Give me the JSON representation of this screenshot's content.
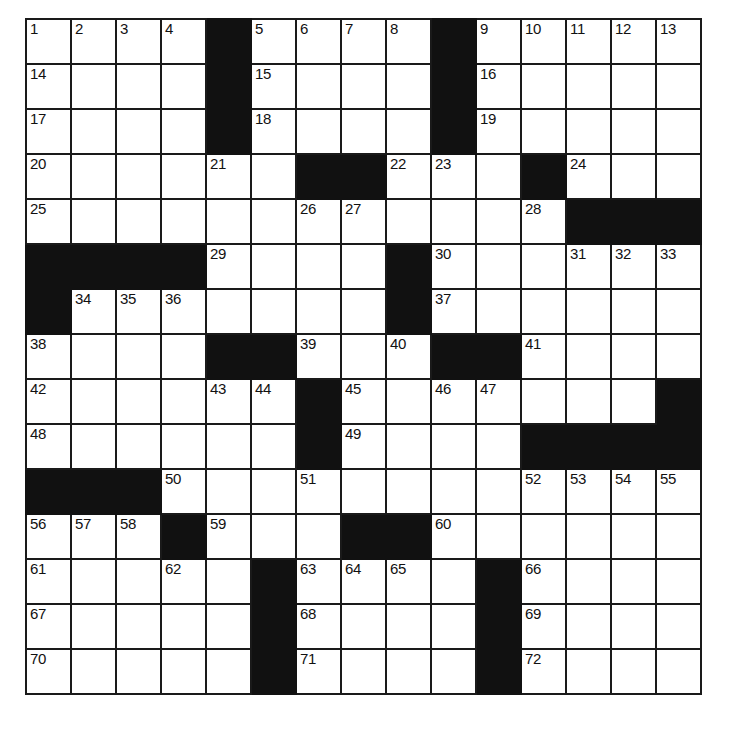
{
  "puzzle": {
    "type": "crossword-grid",
    "rows": 15,
    "columns": 15,
    "cell_size_px": 45,
    "colors": {
      "block": "#111111",
      "cell": "#ffffff",
      "grid_line": "#1a1a1a",
      "number_text": "#111111"
    },
    "grid": [
      [
        {
          "block": false,
          "number": "1"
        },
        {
          "block": false,
          "number": "2"
        },
        {
          "block": false,
          "number": "3"
        },
        {
          "block": false,
          "number": "4"
        },
        {
          "block": true,
          "number": ""
        },
        {
          "block": false,
          "number": "5"
        },
        {
          "block": false,
          "number": "6"
        },
        {
          "block": false,
          "number": "7"
        },
        {
          "block": false,
          "number": "8"
        },
        {
          "block": true,
          "number": ""
        },
        {
          "block": false,
          "number": "9"
        },
        {
          "block": false,
          "number": "10"
        },
        {
          "block": false,
          "number": "11"
        },
        {
          "block": false,
          "number": "12"
        },
        {
          "block": false,
          "number": "13"
        }
      ],
      [
        {
          "block": false,
          "number": "14"
        },
        {
          "block": false,
          "number": ""
        },
        {
          "block": false,
          "number": ""
        },
        {
          "block": false,
          "number": ""
        },
        {
          "block": true,
          "number": ""
        },
        {
          "block": false,
          "number": "15"
        },
        {
          "block": false,
          "number": ""
        },
        {
          "block": false,
          "number": ""
        },
        {
          "block": false,
          "number": ""
        },
        {
          "block": true,
          "number": ""
        },
        {
          "block": false,
          "number": "16"
        },
        {
          "block": false,
          "number": ""
        },
        {
          "block": false,
          "number": ""
        },
        {
          "block": false,
          "number": ""
        },
        {
          "block": false,
          "number": ""
        }
      ],
      [
        {
          "block": false,
          "number": "17"
        },
        {
          "block": false,
          "number": ""
        },
        {
          "block": false,
          "number": ""
        },
        {
          "block": false,
          "number": ""
        },
        {
          "block": true,
          "number": ""
        },
        {
          "block": false,
          "number": "18"
        },
        {
          "block": false,
          "number": ""
        },
        {
          "block": false,
          "number": ""
        },
        {
          "block": false,
          "number": ""
        },
        {
          "block": true,
          "number": ""
        },
        {
          "block": false,
          "number": "19"
        },
        {
          "block": false,
          "number": ""
        },
        {
          "block": false,
          "number": ""
        },
        {
          "block": false,
          "number": ""
        },
        {
          "block": false,
          "number": ""
        }
      ],
      [
        {
          "block": false,
          "number": "20"
        },
        {
          "block": false,
          "number": ""
        },
        {
          "block": false,
          "number": ""
        },
        {
          "block": false,
          "number": ""
        },
        {
          "block": false,
          "number": "21"
        },
        {
          "block": false,
          "number": ""
        },
        {
          "block": true,
          "number": ""
        },
        {
          "block": true,
          "number": ""
        },
        {
          "block": false,
          "number": "22"
        },
        {
          "block": false,
          "number": "23"
        },
        {
          "block": false,
          "number": ""
        },
        {
          "block": true,
          "number": ""
        },
        {
          "block": false,
          "number": "24"
        },
        {
          "block": false,
          "number": ""
        },
        {
          "block": false,
          "number": ""
        }
      ],
      [
        {
          "block": false,
          "number": "25"
        },
        {
          "block": false,
          "number": ""
        },
        {
          "block": false,
          "number": ""
        },
        {
          "block": false,
          "number": ""
        },
        {
          "block": false,
          "number": ""
        },
        {
          "block": false,
          "number": ""
        },
        {
          "block": false,
          "number": "26"
        },
        {
          "block": false,
          "number": "27"
        },
        {
          "block": false,
          "number": ""
        },
        {
          "block": false,
          "number": ""
        },
        {
          "block": false,
          "number": ""
        },
        {
          "block": false,
          "number": "28"
        },
        {
          "block": true,
          "number": ""
        },
        {
          "block": true,
          "number": ""
        },
        {
          "block": true,
          "number": ""
        }
      ],
      [
        {
          "block": true,
          "number": ""
        },
        {
          "block": true,
          "number": ""
        },
        {
          "block": true,
          "number": ""
        },
        {
          "block": true,
          "number": ""
        },
        {
          "block": false,
          "number": "29"
        },
        {
          "block": false,
          "number": ""
        },
        {
          "block": false,
          "number": ""
        },
        {
          "block": false,
          "number": ""
        },
        {
          "block": true,
          "number": ""
        },
        {
          "block": false,
          "number": "30"
        },
        {
          "block": false,
          "number": ""
        },
        {
          "block": false,
          "number": ""
        },
        {
          "block": false,
          "number": "31"
        },
        {
          "block": false,
          "number": "32"
        },
        {
          "block": false,
          "number": "33"
        }
      ],
      [
        {
          "block": true,
          "number": ""
        },
        {
          "block": false,
          "number": "34"
        },
        {
          "block": false,
          "number": "35"
        },
        {
          "block": false,
          "number": "36"
        },
        {
          "block": false,
          "number": ""
        },
        {
          "block": false,
          "number": ""
        },
        {
          "block": false,
          "number": ""
        },
        {
          "block": false,
          "number": ""
        },
        {
          "block": true,
          "number": ""
        },
        {
          "block": false,
          "number": "37"
        },
        {
          "block": false,
          "number": ""
        },
        {
          "block": false,
          "number": ""
        },
        {
          "block": false,
          "number": ""
        },
        {
          "block": false,
          "number": ""
        },
        {
          "block": false,
          "number": ""
        }
      ],
      [
        {
          "block": false,
          "number": "38"
        },
        {
          "block": false,
          "number": ""
        },
        {
          "block": false,
          "number": ""
        },
        {
          "block": false,
          "number": ""
        },
        {
          "block": true,
          "number": ""
        },
        {
          "block": true,
          "number": ""
        },
        {
          "block": false,
          "number": "39"
        },
        {
          "block": false,
          "number": ""
        },
        {
          "block": false,
          "number": "40"
        },
        {
          "block": true,
          "number": ""
        },
        {
          "block": true,
          "number": ""
        },
        {
          "block": false,
          "number": "41"
        },
        {
          "block": false,
          "number": ""
        },
        {
          "block": false,
          "number": ""
        },
        {
          "block": false,
          "number": ""
        }
      ],
      [
        {
          "block": false,
          "number": "42"
        },
        {
          "block": false,
          "number": ""
        },
        {
          "block": false,
          "number": ""
        },
        {
          "block": false,
          "number": ""
        },
        {
          "block": false,
          "number": "43"
        },
        {
          "block": false,
          "number": "44"
        },
        {
          "block": true,
          "number": ""
        },
        {
          "block": false,
          "number": "45"
        },
        {
          "block": false,
          "number": ""
        },
        {
          "block": false,
          "number": "46"
        },
        {
          "block": false,
          "number": "47"
        },
        {
          "block": false,
          "number": ""
        },
        {
          "block": false,
          "number": ""
        },
        {
          "block": false,
          "number": ""
        },
        {
          "block": true,
          "number": ""
        }
      ],
      [
        {
          "block": false,
          "number": "48"
        },
        {
          "block": false,
          "number": ""
        },
        {
          "block": false,
          "number": ""
        },
        {
          "block": false,
          "number": ""
        },
        {
          "block": false,
          "number": ""
        },
        {
          "block": false,
          "number": ""
        },
        {
          "block": true,
          "number": ""
        },
        {
          "block": false,
          "number": "49"
        },
        {
          "block": false,
          "number": ""
        },
        {
          "block": false,
          "number": ""
        },
        {
          "block": false,
          "number": ""
        },
        {
          "block": true,
          "number": ""
        },
        {
          "block": true,
          "number": ""
        },
        {
          "block": true,
          "number": ""
        },
        {
          "block": true,
          "number": ""
        }
      ],
      [
        {
          "block": true,
          "number": ""
        },
        {
          "block": true,
          "number": ""
        },
        {
          "block": true,
          "number": ""
        },
        {
          "block": false,
          "number": "50"
        },
        {
          "block": false,
          "number": ""
        },
        {
          "block": false,
          "number": ""
        },
        {
          "block": false,
          "number": "51"
        },
        {
          "block": false,
          "number": ""
        },
        {
          "block": false,
          "number": ""
        },
        {
          "block": false,
          "number": ""
        },
        {
          "block": false,
          "number": ""
        },
        {
          "block": false,
          "number": "52"
        },
        {
          "block": false,
          "number": "53"
        },
        {
          "block": false,
          "number": "54"
        },
        {
          "block": false,
          "number": "55"
        }
      ],
      [
        {
          "block": false,
          "number": "56"
        },
        {
          "block": false,
          "number": "57"
        },
        {
          "block": false,
          "number": "58"
        },
        {
          "block": true,
          "number": ""
        },
        {
          "block": false,
          "number": "59"
        },
        {
          "block": false,
          "number": ""
        },
        {
          "block": false,
          "number": ""
        },
        {
          "block": true,
          "number": ""
        },
        {
          "block": true,
          "number": ""
        },
        {
          "block": false,
          "number": "60"
        },
        {
          "block": false,
          "number": ""
        },
        {
          "block": false,
          "number": ""
        },
        {
          "block": false,
          "number": ""
        },
        {
          "block": false,
          "number": ""
        },
        {
          "block": false,
          "number": ""
        }
      ],
      [
        {
          "block": false,
          "number": "61"
        },
        {
          "block": false,
          "number": ""
        },
        {
          "block": false,
          "number": ""
        },
        {
          "block": false,
          "number": "62"
        },
        {
          "block": false,
          "number": ""
        },
        {
          "block": true,
          "number": ""
        },
        {
          "block": false,
          "number": "63"
        },
        {
          "block": false,
          "number": "64"
        },
        {
          "block": false,
          "number": "65"
        },
        {
          "block": false,
          "number": ""
        },
        {
          "block": true,
          "number": ""
        },
        {
          "block": false,
          "number": "66"
        },
        {
          "block": false,
          "number": ""
        },
        {
          "block": false,
          "number": ""
        },
        {
          "block": false,
          "number": ""
        }
      ],
      [
        {
          "block": false,
          "number": "67"
        },
        {
          "block": false,
          "number": ""
        },
        {
          "block": false,
          "number": ""
        },
        {
          "block": false,
          "number": ""
        },
        {
          "block": false,
          "number": ""
        },
        {
          "block": true,
          "number": ""
        },
        {
          "block": false,
          "number": "68"
        },
        {
          "block": false,
          "number": ""
        },
        {
          "block": false,
          "number": ""
        },
        {
          "block": false,
          "number": ""
        },
        {
          "block": true,
          "number": ""
        },
        {
          "block": false,
          "number": "69"
        },
        {
          "block": false,
          "number": ""
        },
        {
          "block": false,
          "number": ""
        },
        {
          "block": false,
          "number": ""
        }
      ],
      [
        {
          "block": false,
          "number": "70"
        },
        {
          "block": false,
          "number": ""
        },
        {
          "block": false,
          "number": ""
        },
        {
          "block": false,
          "number": ""
        },
        {
          "block": false,
          "number": ""
        },
        {
          "block": true,
          "number": ""
        },
        {
          "block": false,
          "number": "71"
        },
        {
          "block": false,
          "number": ""
        },
        {
          "block": false,
          "number": ""
        },
        {
          "block": false,
          "number": ""
        },
        {
          "block": true,
          "number": ""
        },
        {
          "block": false,
          "number": "72"
        },
        {
          "block": false,
          "number": ""
        },
        {
          "block": false,
          "number": ""
        },
        {
          "block": false,
          "number": ""
        }
      ]
    ]
  }
}
